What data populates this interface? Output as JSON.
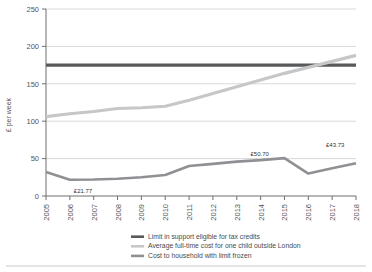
{
  "chart_data": {
    "type": "line",
    "title": "",
    "subtitle": "",
    "xlabel": "",
    "ylabel": "£ per week",
    "x": [
      2005,
      2006,
      2007,
      2008,
      2009,
      2010,
      2011,
      2012,
      2013,
      2014,
      2015,
      2016,
      2017,
      2018
    ],
    "categories": [
      "2005",
      "2006",
      "2007",
      "2008",
      "2009",
      "2010",
      "2011",
      "2012",
      "2013",
      "2014",
      "2015",
      "2016",
      "2017",
      "2018"
    ],
    "ylim": [
      0,
      250
    ],
    "yticks": [
      0,
      50,
      100,
      150,
      200,
      250
    ],
    "ytick_labels": [
      "0",
      "50",
      "100",
      "150",
      "200",
      "250"
    ],
    "grid": true,
    "grid_axis": "y",
    "legend_position": "bottom",
    "series": [
      {
        "name": "Limit in support eligible for tax credits",
        "color": "#58595b",
        "width": 3.2,
        "values": [
          175,
          175,
          175,
          175,
          175,
          175,
          175,
          175,
          175,
          175,
          175,
          175,
          175,
          175
        ]
      },
      {
        "name": "Average full-time cost for one child outside London",
        "color": "#c6c7c9",
        "width": 3.2,
        "values": [
          106,
          110,
          113,
          117,
          118,
          120,
          128,
          137,
          146,
          155,
          164,
          172,
          180,
          188
        ]
      },
      {
        "name": "Cost to household with limit frozen",
        "color": "#8e9093",
        "width": 2.6,
        "values": [
          32,
          21.77,
          22,
          23,
          25,
          28,
          40,
          43,
          46,
          48,
          50.7,
          30,
          37,
          43.73
        ]
      }
    ],
    "annotations": [
      {
        "text": "£21.77",
        "x": 2006,
        "y": 21.77,
        "dx": 4,
        "dy": 13
      },
      {
        "text": "£50.70",
        "x": 2015,
        "y": 50.7,
        "dx": -34,
        "dy": -2
      },
      {
        "text": "£43.73",
        "x": 2018,
        "y": 43.73,
        "dx": -30,
        "dy": -16
      }
    ]
  },
  "legend": {
    "items": [
      {
        "label": "Limit in support eligible for tax credits",
        "color": "#58595b"
      },
      {
        "label": "Average full-time cost for one child outside London",
        "color": "#c6c7c9"
      },
      {
        "label": "Cost to household with limit frozen",
        "color": "#8e9093"
      }
    ]
  },
  "axes": {
    "y_axis_title": "£ per week"
  }
}
